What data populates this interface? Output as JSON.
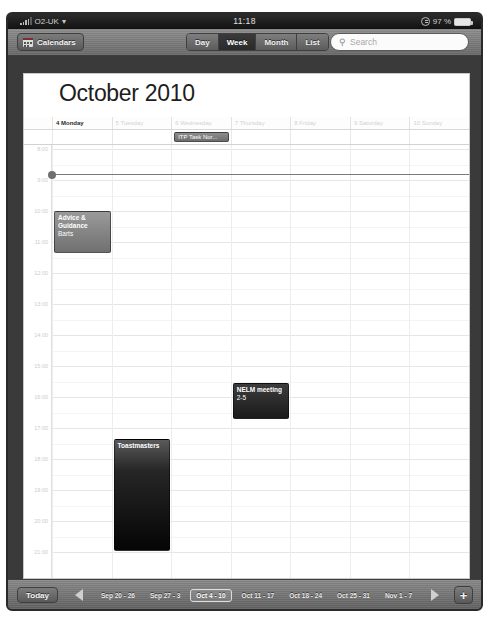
{
  "status_bar": {
    "carrier": "O2-UK",
    "wifi_icon": "wifi-icon",
    "time": "11:18",
    "battery_percent": "97 %",
    "rotation_lock_icon": "rotation-lock-icon"
  },
  "toolbar": {
    "calendars_label": "Calendars",
    "calendars_icon": "calendar-icon",
    "views": [
      {
        "label": "Day",
        "active": false
      },
      {
        "label": "Week",
        "active": true
      },
      {
        "label": "Month",
        "active": false
      },
      {
        "label": "List",
        "active": false
      }
    ],
    "search_placeholder": "Search",
    "search_icon": "search-icon"
  },
  "calendar": {
    "title": "October 2010",
    "gutter_header": "all-day",
    "days": [
      {
        "label": "4 Monday",
        "today": true
      },
      {
        "label": "5 Tuesday",
        "today": false
      },
      {
        "label": "6 Wednesday",
        "today": false
      },
      {
        "label": "7 Thursday",
        "today": false
      },
      {
        "label": "8 Friday",
        "today": false
      },
      {
        "label": "9 Saturday",
        "today": false
      },
      {
        "label": "10 Sunday",
        "today": false
      }
    ],
    "time_labels": [
      "8:00",
      "9:00",
      "10:00",
      "11:00",
      "12:00",
      "13:00",
      "14:00",
      "15:00",
      "16:00",
      "17:00",
      "18:00",
      "19:00",
      "20:00",
      "21:00"
    ],
    "allday_events": [
      {
        "title": "ITP Task Nor...",
        "day_index": 2
      }
    ],
    "events": [
      {
        "title": "Advice &",
        "title_line2": "Guidance",
        "location": "Barts",
        "day_index": 0,
        "style": "grey"
      },
      {
        "title": "NELM meeting",
        "time_text": "2-5",
        "day_index": 3,
        "style": "dark"
      },
      {
        "title": "Toastmasters",
        "day_index": 1,
        "style": "black"
      }
    ]
  },
  "bottom_bar": {
    "today_label": "Today",
    "prev_icon": "previous-arrow-icon",
    "next_icon": "next-arrow-icon",
    "add_label": "+",
    "weeks": [
      {
        "label": "Sep 20 - 26",
        "active": false
      },
      {
        "label": "Sep 27 - 3",
        "active": false
      },
      {
        "label": "Oct 4 - 10",
        "active": true
      },
      {
        "label": "Oct 11 - 17",
        "active": false
      },
      {
        "label": "Oct 18 - 24",
        "active": false
      },
      {
        "label": "Oct 25 - 31",
        "active": false
      },
      {
        "label": "Nov 1 - 7",
        "active": false
      }
    ]
  }
}
